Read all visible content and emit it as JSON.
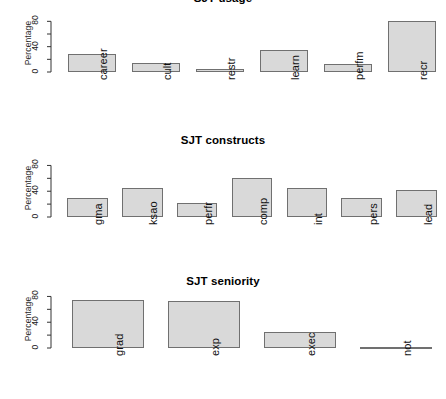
{
  "figure": {
    "background": "#ffffff",
    "bar_fill": "#d9d9d9",
    "bar_stroke": "#707070"
  },
  "chart_data": [
    {
      "type": "bar",
      "title": "SJT usage",
      "xlabel": "",
      "ylabel": "Percentage",
      "ylim": [
        0,
        90
      ],
      "yticks": [
        0,
        20,
        40,
        60,
        80
      ],
      "ytick_labels": [
        "0",
        "",
        "40",
        "",
        "80"
      ],
      "grid": false,
      "legend": "none",
      "categories": [
        "career",
        "cult",
        "restr",
        "learn",
        "perfm",
        "recr"
      ],
      "values": [
        28,
        15,
        5,
        35,
        12,
        80
      ]
    },
    {
      "type": "bar",
      "title": "SJT constructs",
      "xlabel": "",
      "ylabel": "Percentage",
      "ylim": [
        0,
        90
      ],
      "yticks": [
        0,
        20,
        40,
        60,
        80
      ],
      "ytick_labels": [
        "0",
        "",
        "40",
        "",
        "80"
      ],
      "grid": false,
      "legend": "none",
      "categories": [
        "gma",
        "ksao",
        "perfr",
        "comp",
        "int",
        "pers",
        "lead"
      ],
      "values": [
        30,
        45,
        22,
        60,
        45,
        30,
        42
      ]
    },
    {
      "type": "bar",
      "title": "SJT seniority",
      "xlabel": "",
      "ylabel": "Percentage",
      "ylim": [
        0,
        90
      ],
      "yticks": [
        0,
        20,
        40,
        60,
        80
      ],
      "ytick_labels": [
        "0",
        "",
        "40",
        "",
        "80"
      ],
      "grid": false,
      "legend": "none",
      "categories": [
        "grad",
        "exp",
        "exec",
        "not"
      ],
      "values": [
        75,
        73,
        25,
        2
      ]
    }
  ]
}
